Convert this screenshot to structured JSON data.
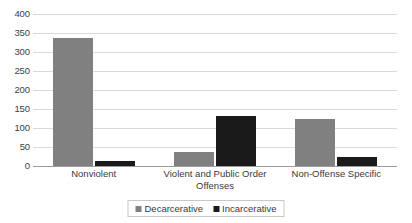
{
  "chart_data": {
    "type": "bar",
    "title": "",
    "subtitle": "",
    "xlabel": "",
    "ylabel": "",
    "ylim": [
      0,
      400
    ],
    "ytick_step": 50,
    "yticks": [
      400,
      350,
      300,
      250,
      200,
      150,
      100,
      50,
      0
    ],
    "grid": true,
    "legend_position": "bottom-center",
    "categories": [
      "Nonviolent",
      "Violent and Public Order Offenses",
      "Non-Offense Specific"
    ],
    "series": [
      {
        "name": "Decarcerative",
        "color": "#808080",
        "values": [
          337,
          37,
          125
        ]
      },
      {
        "name": "Incarcerative",
        "color": "#1a1a1a",
        "values": [
          13,
          131,
          23
        ]
      }
    ]
  },
  "colors": {
    "decarcerative": "#808080",
    "incarcerative": "#1a1a1a",
    "gridline": "#d9d9d9",
    "axis": "#9a9a9a",
    "text": "#3a3a3a",
    "background": "#ffffff"
  }
}
